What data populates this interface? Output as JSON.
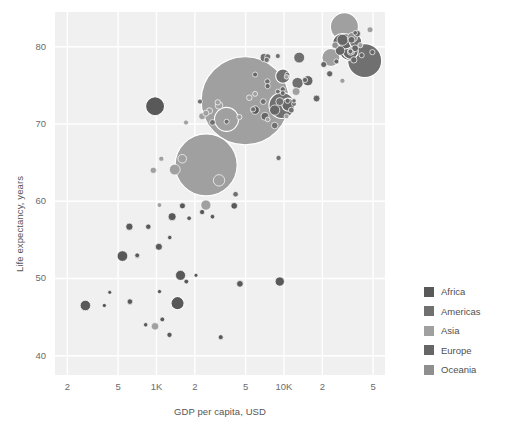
{
  "chart_data": {
    "type": "scatter",
    "title": "",
    "xlabel": "GDP per capita, USD",
    "ylabel": "Life expectancy, years",
    "xscale": "log",
    "yscale": "linear",
    "xlim": [
      160,
      62000
    ],
    "ylim": [
      37.5,
      84.5
    ],
    "grid": true,
    "legend_position": "right",
    "bubble_encoding": "population",
    "x_ticks": [
      {
        "value": 200,
        "label": "2"
      },
      {
        "value": 500,
        "label": "5"
      },
      {
        "value": 1000,
        "label": "1K"
      },
      {
        "value": 2000,
        "label": "2"
      },
      {
        "value": 5000,
        "label": "5"
      },
      {
        "value": 10000,
        "label": "10K"
      },
      {
        "value": 20000,
        "label": "2"
      },
      {
        "value": 50000,
        "label": "5"
      }
    ],
    "y_ticks": [
      {
        "value": 80,
        "label": "80"
      },
      {
        "value": 70,
        "label": "70"
      },
      {
        "value": 60,
        "label": "60"
      },
      {
        "value": 50,
        "label": "50"
      },
      {
        "value": 40,
        "label": "40"
      }
    ],
    "legend": [
      {
        "name": "Africa",
        "color": "#595959"
      },
      {
        "name": "Americas",
        "color": "#707070"
      },
      {
        "name": "Asia",
        "color": "#a0a0a0"
      },
      {
        "name": "Europe",
        "color": "#666666"
      },
      {
        "name": "Oceania",
        "color": "#8f8f8f"
      }
    ],
    "series": [
      {
        "name": "Africa",
        "color": "#595959",
        "points": [
          {
            "x": 975,
            "y": 72.3,
            "r": 9.5
          },
          {
            "x": 1265,
            "y": 42.7,
            "r": 2.6
          },
          {
            "x": 613,
            "y": 56.7,
            "r": 3.6
          },
          {
            "x": 1544,
            "y": 50.4,
            "r": 5.0
          },
          {
            "x": 707,
            "y": 52.9,
            "r": 2.5
          },
          {
            "x": 1714,
            "y": 49.6,
            "r": 2.4
          },
          {
            "x": 2042,
            "y": 50.4,
            "r": 2.0
          },
          {
            "x": 1111,
            "y": 44.7,
            "r": 2.4
          },
          {
            "x": 390,
            "y": 46.5,
            "r": 2.1
          },
          {
            "x": 1044,
            "y": 54.1,
            "r": 3.5
          },
          {
            "x": 1327,
            "y": 58.0,
            "r": 4.0
          },
          {
            "x": 863,
            "y": 56.7,
            "r": 2.7
          },
          {
            "x": 277,
            "y": 46.5,
            "r": 5.2
          },
          {
            "x": 541,
            "y": 52.9,
            "r": 5.3
          },
          {
            "x": 1598,
            "y": 59.4,
            "r": 3.0
          },
          {
            "x": 2280,
            "y": 58.6,
            "r": 2.6
          },
          {
            "x": 2749,
            "y": 58.0,
            "r": 2.3
          },
          {
            "x": 619,
            "y": 47.0,
            "r": 2.8
          },
          {
            "x": 823,
            "y": 44.0,
            "r": 2.2
          },
          {
            "x": 1463,
            "y": 46.8,
            "r": 6.6
          },
          {
            "x": 4513,
            "y": 49.3,
            "r": 3.3
          },
          {
            "x": 3190,
            "y": 42.4,
            "r": 2.5
          },
          {
            "x": 9270,
            "y": 49.6,
            "r": 4.6
          },
          {
            "x": 5937,
            "y": 71.8,
            "r": 4.2
          },
          {
            "x": 4072,
            "y": 59.4,
            "r": 3.3
          },
          {
            "x": 1056,
            "y": 48.3,
            "r": 2.1
          },
          {
            "x": 430,
            "y": 48.2,
            "r": 2.0
          },
          {
            "x": 706,
            "y": 53.0,
            "r": 2.4
          },
          {
            "x": 1271,
            "y": 55.3,
            "r": 2.2
          },
          {
            "x": 1803,
            "y": 57.8,
            "r": 2.3
          }
        ]
      },
      {
        "name": "Americas",
        "color": "#707070",
        "points": [
          {
            "x": 12779,
            "y": 75.3,
            "r": 5.6
          },
          {
            "x": 9065,
            "y": 65.6,
            "r": 2.6
          },
          {
            "x": 9645,
            "y": 72.4,
            "r": 13.0
          },
          {
            "x": 13171,
            "y": 78.6,
            "r": 5.4
          },
          {
            "x": 7006,
            "y": 78.6,
            "r": 4.1
          },
          {
            "x": 9269,
            "y": 72.9,
            "r": 4.0
          },
          {
            "x": 8948,
            "y": 78.8,
            "r": 2.5
          },
          {
            "x": 7320,
            "y": 78.3,
            "r": 2.6
          },
          {
            "x": 6873,
            "y": 72.9,
            "r": 2.9
          },
          {
            "x": 5728,
            "y": 71.9,
            "r": 2.6
          },
          {
            "x": 3548,
            "y": 70.3,
            "r": 2.5
          },
          {
            "x": 4172,
            "y": 60.9,
            "r": 2.8
          },
          {
            "x": 11978,
            "y": 72.6,
            "r": 2.4
          },
          {
            "x": 2749,
            "y": 70.2,
            "r": 2.9
          },
          {
            "x": 9809,
            "y": 76.2,
            "r": 7.2
          },
          {
            "x": 2194,
            "y": 72.9,
            "r": 2.5
          },
          {
            "x": 7409,
            "y": 75.5,
            "r": 2.7
          },
          {
            "x": 11416,
            "y": 71.8,
            "r": 2.9
          },
          {
            "x": 7458,
            "y": 78.7,
            "r": 3.0
          },
          {
            "x": 8458,
            "y": 69.8,
            "r": 3.3
          },
          {
            "x": 8948,
            "y": 74.2,
            "r": 2.4
          },
          {
            "x": 10611,
            "y": 76.4,
            "r": 2.4
          },
          {
            "x": 42952,
            "y": 78.2,
            "r": 17.0
          },
          {
            "x": 36319,
            "y": 80.7,
            "r": 6.3
          },
          {
            "x": 11977,
            "y": 73.0,
            "r": 2.2
          }
        ]
      },
      {
        "name": "Asia",
        "color": "#a0a0a0",
        "points": [
          {
            "x": 974,
            "y": 43.8,
            "r": 3.8
          },
          {
            "x": 1391,
            "y": 64.1,
            "r": 5.4
          },
          {
            "x": 4959,
            "y": 73.0,
            "r": 44.0
          },
          {
            "x": 2452,
            "y": 64.7,
            "r": 31.0
          },
          {
            "x": 3541,
            "y": 70.6,
            "r": 12.0
          },
          {
            "x": 29796,
            "y": 82.6,
            "r": 14.0
          },
          {
            "x": 1593,
            "y": 65.5,
            "r": 4.3
          },
          {
            "x": 2441,
            "y": 71.4,
            "r": 3.0
          },
          {
            "x": 23348,
            "y": 78.6,
            "r": 9.0
          },
          {
            "x": 47307,
            "y": 82.2,
            "r": 3.0
          },
          {
            "x": 12450,
            "y": 74.2,
            "r": 4.0
          },
          {
            "x": 3095,
            "y": 62.7,
            "r": 5.7
          },
          {
            "x": 1091,
            "y": 65.5,
            "r": 2.6
          },
          {
            "x": 944,
            "y": 64.0,
            "r": 3.2
          },
          {
            "x": 2280,
            "y": 71.0,
            "r": 3.4
          },
          {
            "x": 4471,
            "y": 70.9,
            "r": 2.6
          },
          {
            "x": 3095,
            "y": 72.4,
            "r": 3.8
          },
          {
            "x": 10461,
            "y": 71.0,
            "r": 2.5
          },
          {
            "x": 28718,
            "y": 75.6,
            "r": 2.6
          },
          {
            "x": 5348,
            "y": 73.4,
            "r": 2.8
          },
          {
            "x": 2605,
            "y": 71.7,
            "r": 3.1
          },
          {
            "x": 1704,
            "y": 70.2,
            "r": 2.5
          },
          {
            "x": 7458,
            "y": 70.6,
            "r": 2.4
          },
          {
            "x": 3025,
            "y": 72.8,
            "r": 2.7
          },
          {
            "x": 39725,
            "y": 80.2,
            "r": 2.6
          },
          {
            "x": 1056,
            "y": 59.5,
            "r": 2.4
          },
          {
            "x": 2441,
            "y": 59.5,
            "r": 5.1
          },
          {
            "x": 5937,
            "y": 73.9,
            "r": 2.5
          },
          {
            "x": 10461,
            "y": 76.1,
            "r": 2.3
          }
        ]
      },
      {
        "name": "Europe",
        "color": "#666666",
        "points": [
          {
            "x": 5937,
            "y": 76.4,
            "r": 2.5
          },
          {
            "x": 36126,
            "y": 79.8,
            "r": 3.4
          },
          {
            "x": 33693,
            "y": 79.4,
            "r": 3.6
          },
          {
            "x": 7446,
            "y": 74.9,
            "r": 2.6
          },
          {
            "x": 10681,
            "y": 73.0,
            "r": 2.6
          },
          {
            "x": 14619,
            "y": 75.7,
            "r": 2.6
          },
          {
            "x": 22833,
            "y": 76.5,
            "r": 3.1
          },
          {
            "x": 35278,
            "y": 78.3,
            "r": 3.2
          },
          {
            "x": 33207,
            "y": 79.3,
            "r": 3.0
          },
          {
            "x": 30470,
            "y": 80.7,
            "r": 7.6
          },
          {
            "x": 32170,
            "y": 79.4,
            "r": 9.0
          },
          {
            "x": 27538,
            "y": 79.5,
            "r": 4.7
          },
          {
            "x": 18009,
            "y": 73.3,
            "r": 3.4
          },
          {
            "x": 36180,
            "y": 81.8,
            "r": 2.3
          },
          {
            "x": 40676,
            "y": 78.9,
            "r": 2.6
          },
          {
            "x": 28570,
            "y": 80.5,
            "r": 9.4
          },
          {
            "x": 33203,
            "y": 79.4,
            "r": 2.4
          },
          {
            "x": 49357,
            "y": 79.3,
            "r": 2.6
          },
          {
            "x": 15389,
            "y": 75.6,
            "r": 5.1
          },
          {
            "x": 20510,
            "y": 77.7,
            "r": 3.0
          },
          {
            "x": 10808,
            "y": 72.5,
            "r": 6.6
          },
          {
            "x": 9786,
            "y": 74.5,
            "r": 2.6
          },
          {
            "x": 7092,
            "y": 71.0,
            "r": 4.0
          },
          {
            "x": 28821,
            "y": 80.9,
            "r": 5.6
          },
          {
            "x": 33860,
            "y": 80.9,
            "r": 3.4
          },
          {
            "x": 37506,
            "y": 81.7,
            "r": 3.3
          },
          {
            "x": 8458,
            "y": 71.8,
            "r": 5.1
          },
          {
            "x": 33203,
            "y": 79.4,
            "r": 7.8
          },
          {
            "x": 25768,
            "y": 78.1,
            "r": 2.5
          },
          {
            "x": 9786,
            "y": 74.0,
            "r": 2.4
          }
        ]
      },
      {
        "name": "Oceania",
        "color": "#8f8f8f",
        "points": [
          {
            "x": 34435,
            "y": 81.2,
            "r": 5.0
          },
          {
            "x": 25185,
            "y": 80.2,
            "r": 3.3
          }
        ]
      }
    ]
  }
}
